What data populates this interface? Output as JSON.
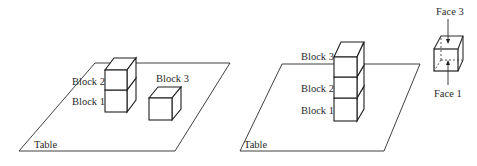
{
  "scenes": [
    {
      "id": "initial-state",
      "table_label": "Table",
      "blocks": [
        {
          "label": "Block 2",
          "position": "stacked on Block 1"
        },
        {
          "label": "Block 1",
          "position": "on table"
        },
        {
          "label": "Block 3",
          "position": "on table"
        }
      ]
    },
    {
      "id": "goal-state",
      "table_label": "Table",
      "blocks": [
        {
          "label": "Block 3",
          "position": "top of stack"
        },
        {
          "label": "Block 2",
          "position": "middle of stack"
        },
        {
          "label": "Block 1",
          "position": "bottom, on table"
        }
      ]
    }
  ],
  "face_diagram": {
    "top_label": "Face 3",
    "bottom_label": "Face 1"
  },
  "colors": {
    "line": "#1e1e1e",
    "text": "#2a2a2a",
    "background": "#ffffff"
  }
}
